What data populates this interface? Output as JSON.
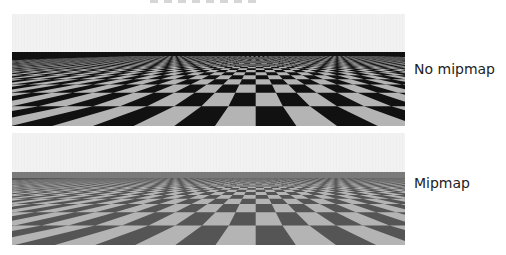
{
  "figure": {
    "panels": [
      {
        "id": "no-mipmap",
        "label": "No mipmap"
      },
      {
        "id": "mipmap",
        "label": "Mipmap"
      }
    ]
  },
  "colors": {
    "sky": "#f2f2f2",
    "tile_light": "#b4b4b4",
    "tile_dark": "#111111",
    "label_text": "#222222"
  }
}
